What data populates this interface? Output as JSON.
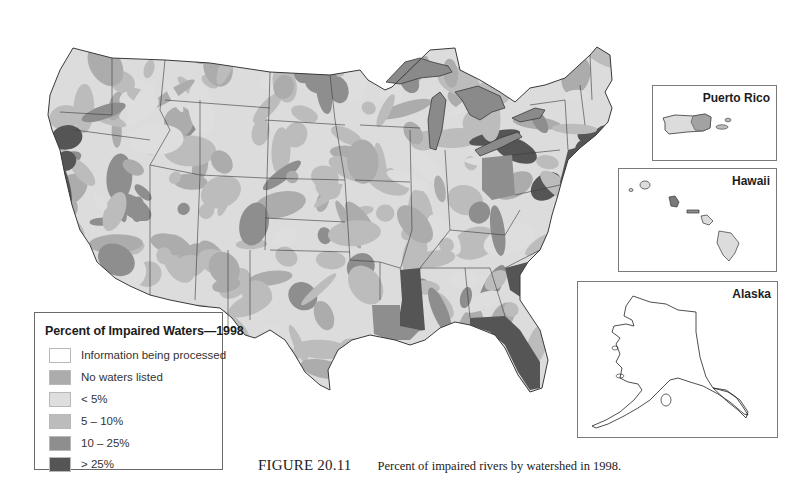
{
  "figure": {
    "label": "FIGURE 20.11",
    "caption": "Percent of impaired rivers by watershed in 1998."
  },
  "legend": {
    "title": "Percent of Impaired Waters—1998",
    "items": [
      {
        "label": "Information being processed",
        "color": "#ffffff"
      },
      {
        "label": "No waters listed",
        "color": "#acacac"
      },
      {
        "label": "< 5%",
        "color": "#dedede"
      },
      {
        "label": "5 – 10%",
        "color": "#bcbcbc"
      },
      {
        "label": "10 – 25%",
        "color": "#8e8e8e"
      },
      {
        "label": "> 25%",
        "color": "#555555"
      }
    ]
  },
  "insets": {
    "puerto_rico": {
      "title": "Puerto Rico"
    },
    "hawaii": {
      "title": "Hawaii"
    },
    "alaska": {
      "title": "Alaska"
    }
  },
  "map": {
    "subject": "Contiguous United States",
    "border_color": "#3a3a3a",
    "great_lakes_category": "10 – 25%",
    "highlighted_states": [
      {
        "name": "Mississippi",
        "category": "> 25%"
      },
      {
        "name": "New Jersey",
        "category": "> 25%"
      },
      {
        "name": "Delaware",
        "category": "> 25%"
      },
      {
        "name": "South Carolina",
        "category": "> 25%"
      },
      {
        "name": "Florida",
        "category": "> 25%"
      },
      {
        "name": "Ohio",
        "category": "10 – 25%"
      },
      {
        "name": "Louisiana",
        "category": "10 – 25%"
      }
    ]
  }
}
